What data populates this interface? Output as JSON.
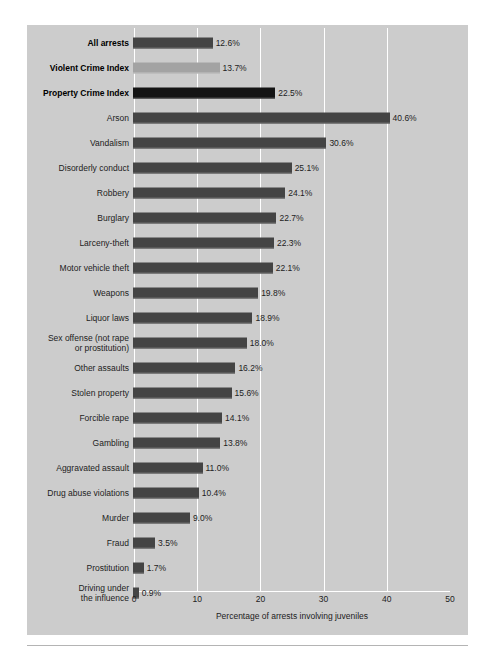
{
  "chart_data": {
    "type": "bar",
    "orientation": "horizontal",
    "title": "",
    "xlabel": "Percentage of arrests involving juveniles",
    "ylabel": "",
    "xlim": [
      0,
      50
    ],
    "xticks": [
      "0",
      "10",
      "20",
      "30",
      "40",
      "50"
    ],
    "gridlines": [
      10,
      20,
      30,
      40
    ],
    "grid": true,
    "legend": "none",
    "categories": [
      "All arrests",
      "Violent Crime Index",
      "Property Crime Index",
      "Arson",
      "Vandalism",
      "Disorderly conduct",
      "Robbery",
      "Burglary",
      "Larceny-theft",
      "Motor vehicle theft",
      "Weapons",
      "Liquor laws",
      "Sex offense (not rape\nor prostitution)",
      "Other assaults",
      "Stolen property",
      "Forcible rape",
      "Gambling",
      "Aggravated assault",
      "Drug abuse violations",
      "Murder",
      "Fraud",
      "Prostitution",
      "Driving under\nthe influence"
    ],
    "values": [
      12.6,
      13.7,
      22.5,
      40.6,
      30.6,
      25.1,
      24.1,
      22.7,
      22.3,
      22.1,
      19.8,
      18.9,
      18.0,
      16.2,
      15.6,
      14.1,
      13.8,
      11.0,
      10.4,
      9.0,
      3.5,
      1.7,
      0.9
    ],
    "value_labels": [
      "12.6%",
      "13.7%",
      "22.5%",
      "40.6%",
      "30.6%",
      "25.1%",
      "24.1%",
      "22.7%",
      "22.3%",
      "22.1%",
      "19.8%",
      "18.9%",
      "18.0%",
      "16.2%",
      "15.6%",
      "14.1%",
      "13.8%",
      "11.0%",
      "10.4%",
      "9.0%",
      "3.5%",
      "1.7%",
      "0.9%"
    ],
    "emphasis": [
      true,
      true,
      true,
      false,
      false,
      false,
      false,
      false,
      false,
      false,
      false,
      false,
      false,
      false,
      false,
      false,
      false,
      false,
      false,
      false,
      false,
      false,
      false
    ],
    "bar_tones": [
      "dark",
      "light",
      "black",
      "dark",
      "dark",
      "dark",
      "dark",
      "dark",
      "dark",
      "dark",
      "dark",
      "dark",
      "dark",
      "dark",
      "dark",
      "dark",
      "dark",
      "dark",
      "dark",
      "dark",
      "dark",
      "dark",
      "dark"
    ],
    "colors": {
      "panel_background": "#cccccc",
      "page_background": "#ffffff",
      "bar_dark": "#444444",
      "bar_light": "#a3a3a3",
      "bar_black": "#141414",
      "gridline": "#ffffff",
      "text": "#1c1c1c"
    }
  }
}
